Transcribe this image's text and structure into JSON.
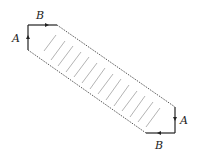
{
  "diagram": {
    "labels": [
      {
        "id": "B_top",
        "text": "B",
        "x": 40,
        "y": 18
      },
      {
        "id": "A_left",
        "text": "A",
        "x": 15,
        "y": 41
      },
      {
        "id": "A_right",
        "text": "A",
        "x": 180,
        "y": 123
      },
      {
        "id": "B_bottom",
        "text": "B",
        "x": 156,
        "y": 149
      }
    ],
    "colors": {
      "edge": "#222222",
      "dotted": "#444444",
      "hatch": "#aaaaaa"
    },
    "hatch_count": 14
  }
}
